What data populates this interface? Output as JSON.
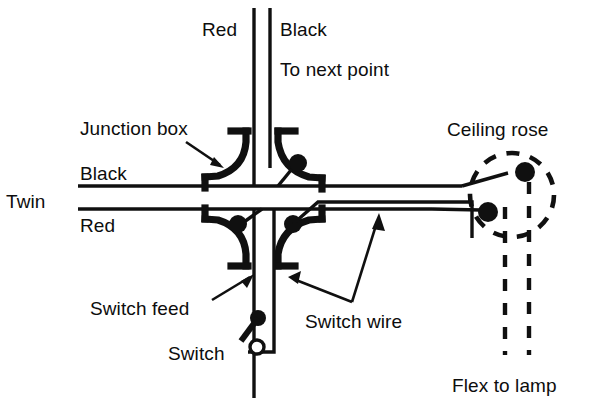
{
  "diagram": {
    "background_color": "#ffffff",
    "ink_color": "#101010",
    "width": 598,
    "height": 406
  },
  "labels": {
    "red_top": "Red",
    "black_top": "Black",
    "to_next_point": "To next point",
    "junction_box": "Junction box",
    "black_left": "Black",
    "twin": "Twin",
    "red_left": "Red",
    "ceiling_rose": "Ceiling rose",
    "switch_feed": "Switch feed",
    "switch_wire": "Switch wire",
    "switch": "Switch",
    "flex_to_lamp": "Flex to lamp"
  },
  "components": {
    "junction_boxes": [
      {
        "name": "junction-box-top-left",
        "position": "top-left",
        "has_terminal_dot": false
      },
      {
        "name": "junction-box-top-right",
        "position": "top-right",
        "has_terminal_dot": true
      },
      {
        "name": "junction-box-bottom-left",
        "position": "bottom-left",
        "has_terminal_dot": true
      },
      {
        "name": "junction-box-bottom-right",
        "position": "bottom-right",
        "has_terminal_dot": true
      }
    ],
    "ceiling_rose": {
      "style": "dashed-circle",
      "center_x": 512,
      "center_y": 195,
      "radius": 42,
      "terminals": 2
    },
    "switch": {
      "style": "single-pole-lever",
      "pivot_x": 258,
      "pivot_y": 318,
      "contact_x": 257,
      "contact_y": 348
    },
    "flex_to_lamp": {
      "style": "dashed-pair",
      "conductors": 2
    }
  },
  "conductors": {
    "vertical_top": [
      {
        "name": "red",
        "x": 254
      },
      {
        "name": "black",
        "x": 270
      }
    ],
    "twin_horizontal": [
      {
        "name": "black",
        "y": 186
      },
      {
        "name": "red",
        "y": 209
      }
    ]
  }
}
